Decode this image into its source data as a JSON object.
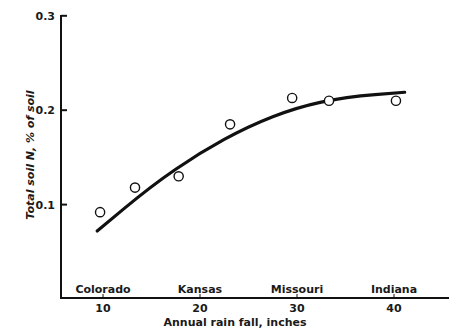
{
  "chart_data": {
    "type": "scatter",
    "title": "",
    "xlabel": "Annual rain fall, inches",
    "ylabel": "Total soil N, % of soil",
    "xlim": [
      5,
      45
    ],
    "ylim": [
      0,
      0.3
    ],
    "x_ticks": [
      10,
      20,
      30,
      40
    ],
    "y_ticks": [
      0.1,
      0.2,
      0.3
    ],
    "x_tick_labels": [
      "10",
      "20",
      "30",
      "40"
    ],
    "y_tick_labels": [
      "0.1",
      "0.2",
      "0.3"
    ],
    "grid": false,
    "legend": null,
    "region_labels": [
      {
        "label": "Colorado",
        "x": 10
      },
      {
        "label": "Kansas",
        "x": 20
      },
      {
        "label": "Missouri",
        "x": 30
      },
      {
        "label": "Indiana",
        "x": 40
      }
    ],
    "series": [
      {
        "name": "Observed",
        "marker": "open-circle",
        "x": [
          9.7,
          13.3,
          17.8,
          23.1,
          29.5,
          33.3,
          40.2
        ],
        "y": [
          0.092,
          0.118,
          0.13,
          0.185,
          0.213,
          0.21,
          0.21
        ]
      },
      {
        "name": "Fitted curve",
        "style": "thick-line",
        "x": [
          9.4,
          15,
          20,
          25,
          30,
          35,
          41.1
        ],
        "y": [
          0.072,
          0.12,
          0.155,
          0.183,
          0.203,
          0.214,
          0.219
        ]
      }
    ]
  },
  "axes": {
    "x_title": "Annual rain fall, inches",
    "y_title": "Total soil N, % of soil"
  }
}
